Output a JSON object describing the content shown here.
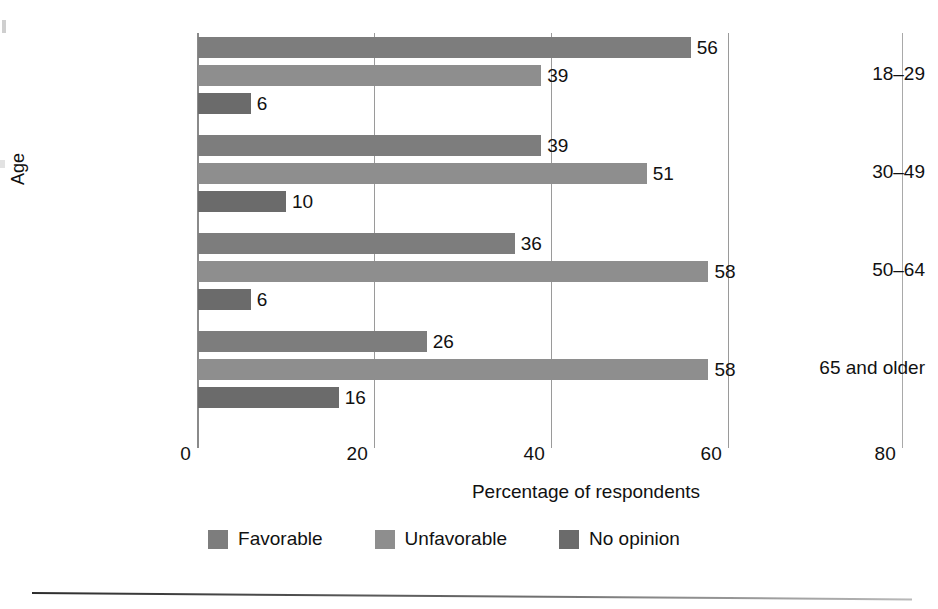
{
  "chart_data": {
    "type": "bar",
    "orientation": "horizontal",
    "title": "",
    "xlabel": "Percentage of respondents",
    "ylabel": "Age",
    "categories": [
      "18–29",
      "30–49",
      "50–64",
      "65 and older"
    ],
    "series": [
      {
        "name": "Favorable",
        "color": "#7d7d7d",
        "values": [
          56,
          39,
          36,
          26
        ]
      },
      {
        "name": "Unfavorable",
        "color": "#8e8e8e",
        "values": [
          39,
          51,
          58,
          58
        ]
      },
      {
        "name": "No opinion",
        "color": "#6b6b6b",
        "values": [
          6,
          10,
          6,
          16
        ]
      }
    ],
    "value_labels": [
      [
        "56",
        "39",
        "6"
      ],
      [
        "39",
        "51",
        "10"
      ],
      [
        "36",
        "58",
        "6"
      ],
      [
        "26",
        "58",
        "16"
      ]
    ],
    "xlim": [
      0,
      80
    ],
    "xticks": [
      0,
      20,
      40,
      60,
      80
    ],
    "xtick_labels": [
      "0",
      "20",
      "40",
      "60",
      "80"
    ],
    "grid": "vertical-gridlines-at-xticks",
    "legend_position": "bottom-center",
    "legend_entries": [
      "Favorable",
      "Unfavorable",
      "No opinion"
    ],
    "axis_color": "#8a8a8a",
    "grid_color": "#9a9a9a",
    "text_color": "#111111",
    "background": "#ffffff"
  }
}
